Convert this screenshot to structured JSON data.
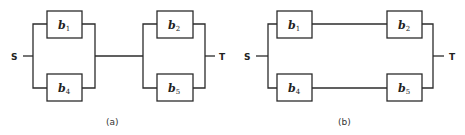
{
  "diagrams": [
    {
      "id": "a",
      "caption": "(a)",
      "source_label": "S",
      "sink_label": "T",
      "topology": "series of two parallel pairs",
      "blocks": [
        {
          "name": "b",
          "sub": "1"
        },
        {
          "name": "b",
          "sub": "4"
        },
        {
          "name": "b",
          "sub": "2"
        },
        {
          "name": "b",
          "sub": "5"
        }
      ]
    },
    {
      "id": "b",
      "caption": "(b)",
      "source_label": "S",
      "sink_label": "T",
      "topology": "parallel of two series pairs",
      "blocks": [
        {
          "name": "b",
          "sub": "1"
        },
        {
          "name": "b",
          "sub": "4"
        },
        {
          "name": "b",
          "sub": "2"
        },
        {
          "name": "b",
          "sub": "5"
        }
      ]
    }
  ]
}
